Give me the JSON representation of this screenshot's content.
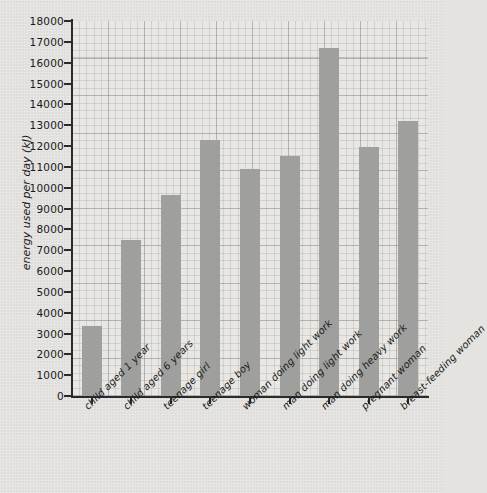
{
  "chart_data": {
    "type": "bar",
    "title": "",
    "xlabel": "",
    "ylabel": "energy used per day (kJ)",
    "ylim": [
      0,
      18000
    ],
    "ytick_step": 1000,
    "grid": true,
    "legend": "none",
    "bar_color": "#9fa09d",
    "background_color": "#e4e3e0",
    "plot_background_color": "#e8e7e4",
    "axis_color": "#2b2b2b",
    "categories": [
      "child aged 1 year",
      "child aged 6 years",
      "teenage girl",
      "teenage boy",
      "woman doing light work",
      "man doing light work",
      "man doing heavy work",
      "pregnant woman",
      "breast-feeding woman"
    ],
    "values": [
      3350,
      7500,
      9650,
      12300,
      10900,
      11500,
      16700,
      11950,
      13200
    ],
    "ytick_labels": [
      "18000",
      "17000",
      "16000",
      "15000",
      "14000",
      "13000",
      "12000",
      "11000",
      "10000",
      "9000",
      "8000",
      "7000",
      "6000",
      "5000",
      "4000",
      "3000",
      "2000",
      "1000",
      "0"
    ],
    "ytick_values": [
      18000,
      17000,
      16000,
      15000,
      14000,
      13000,
      12000,
      11000,
      10000,
      9000,
      8000,
      7000,
      6000,
      5000,
      4000,
      3000,
      2000,
      1000,
      0
    ]
  }
}
